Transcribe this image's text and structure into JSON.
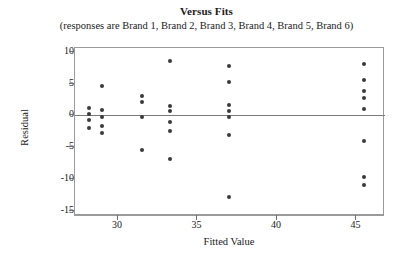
{
  "chart_data": {
    "type": "scatter",
    "title": "Versus Fits",
    "subtitle": "(responses are Brand 1, Brand 2, Brand 3, Brand 4, Brand 5, Brand 6)",
    "xlabel": "Fitted Value",
    "ylabel": "Residual",
    "xlim": [
      27.3,
      46.8
    ],
    "ylim": [
      -15.8,
      10.6
    ],
    "xticks": [
      30,
      35,
      40,
      45
    ],
    "yticks": [
      10,
      5,
      0,
      -5,
      -10,
      -15
    ],
    "xtick_labels": [
      "30",
      "35",
      "40",
      "45"
    ],
    "ytick_labels": [
      "10",
      "5",
      "0",
      "-5",
      "-10",
      "-15"
    ],
    "grid": false,
    "legend": null,
    "reference_line": {
      "orientation": "horizontal",
      "y": 0
    },
    "marker": {
      "shape": "circle",
      "color": "#3a3a3a",
      "size": 4
    },
    "points": [
      {
        "x": 28.2,
        "y": 1.2
      },
      {
        "x": 28.2,
        "y": 0.3
      },
      {
        "x": 28.2,
        "y": -0.7
      },
      {
        "x": 28.2,
        "y": -2.0
      },
      {
        "x": 29.0,
        "y": 4.7
      },
      {
        "x": 29.0,
        "y": 0.8
      },
      {
        "x": 29.0,
        "y": -0.2
      },
      {
        "x": 29.0,
        "y": -1.6
      },
      {
        "x": 29.0,
        "y": -2.7
      },
      {
        "x": 31.5,
        "y": 3.0
      },
      {
        "x": 31.5,
        "y": 2.1
      },
      {
        "x": 31.5,
        "y": -0.2
      },
      {
        "x": 31.5,
        "y": -5.4
      },
      {
        "x": 33.3,
        "y": 8.6
      },
      {
        "x": 33.3,
        "y": 1.5
      },
      {
        "x": 33.3,
        "y": 0.7
      },
      {
        "x": 33.3,
        "y": -1.0
      },
      {
        "x": 33.3,
        "y": -2.5
      },
      {
        "x": 33.3,
        "y": -6.9
      },
      {
        "x": 37.0,
        "y": 7.8
      },
      {
        "x": 37.0,
        "y": 5.2
      },
      {
        "x": 37.0,
        "y": 1.6
      },
      {
        "x": 37.0,
        "y": 0.7
      },
      {
        "x": 37.0,
        "y": -0.2
      },
      {
        "x": 37.0,
        "y": -3.0
      },
      {
        "x": 37.0,
        "y": -12.8
      },
      {
        "x": 45.5,
        "y": 8.1
      },
      {
        "x": 45.5,
        "y": 5.5
      },
      {
        "x": 45.5,
        "y": 3.8
      },
      {
        "x": 45.5,
        "y": 2.8
      },
      {
        "x": 45.5,
        "y": 1.0
      },
      {
        "x": 45.5,
        "y": -4.0
      },
      {
        "x": 45.5,
        "y": -9.6
      },
      {
        "x": 45.5,
        "y": -11.0
      }
    ]
  }
}
